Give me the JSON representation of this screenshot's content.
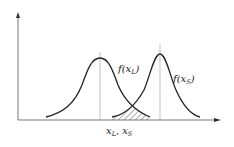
{
  "diagram": {
    "type": "overlapping-distributions",
    "axes": {
      "x_axis_arrow": true,
      "y_axis_arrow": true
    },
    "curves": [
      {
        "id": "left",
        "label_main": "f(x",
        "label_sub": "L",
        "label_close": ")",
        "peak_x": 100,
        "peak_y": 58
      },
      {
        "id": "right",
        "label_main": "f(x",
        "label_sub": "S",
        "label_close": ")",
        "peak_x": 160,
        "peak_y": 54
      }
    ],
    "x_label": {
      "a": "x",
      "a_sub": "L",
      "sep": ",",
      "b": "x",
      "b_sub": "S"
    },
    "overlap_region": "hatched",
    "colors": {
      "line": "#222222",
      "guide": "#888888",
      "hatch": "#333333"
    }
  }
}
